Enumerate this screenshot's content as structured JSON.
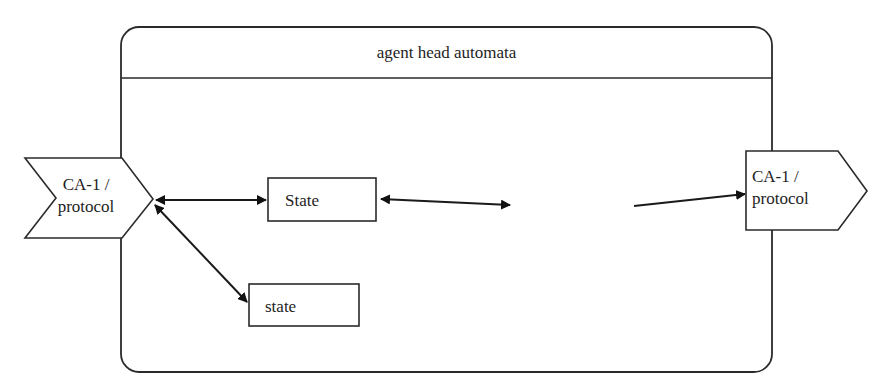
{
  "diagram": {
    "title": "agent head automata",
    "nodes": {
      "left_port": {
        "line1": "CA-1 /",
        "line2": "protocol",
        "shape": "chevron"
      },
      "right_port": {
        "line1": "CA-1 /",
        "line2": "protocol",
        "shape": "pentagon-arrow"
      },
      "state_upper": {
        "label": "State",
        "shape": "rectangle"
      },
      "state_lower": {
        "label": "state",
        "shape": "rectangle"
      }
    },
    "edges": [
      {
        "from": "left_port",
        "to": "state_upper",
        "type": "bidirectional"
      },
      {
        "from": "left_port",
        "to": "state_lower",
        "type": "bidirectional"
      },
      {
        "from": "state_upper",
        "to": "(blank)",
        "type": "bidirectional"
      },
      {
        "from": "(blank)",
        "to": "right_port",
        "type": "directed"
      }
    ],
    "colors": {
      "stroke": "#2a2a2a",
      "background": "#ffffff",
      "arrowhead": "#111111"
    }
  }
}
